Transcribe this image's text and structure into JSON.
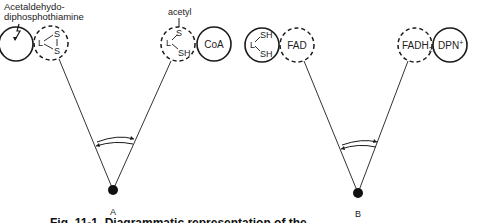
{
  "panels": {
    "A": {
      "label": "A",
      "carrier_label_line1": "Acetaldehydo-",
      "carrier_label_line2": "diphosphothiamine",
      "left_dashed_circle": {
        "L": "L",
        "S_top": "S",
        "S_bottom": "S"
      },
      "right_dashed_circle": {
        "substituent": "acetyl",
        "L": "L",
        "S_top": "S",
        "SH_bottom": "SH"
      },
      "partner_circle": "CoA"
    },
    "B": {
      "label": "B",
      "left_solid_circle": {
        "L": "L",
        "SH_top": "SH",
        "SH_bottom": "SH"
      },
      "left_dashed_circle": "FAD",
      "right_dashed_circle_base": "FADH",
      "right_dashed_circle_sub": "2",
      "partner_circle_base": "DPN",
      "partner_circle_sup": "+"
    }
  },
  "caption": {
    "text": "Fig. 11-1. Diagrammatic representation of the ...",
    "visibility": "partially cut off at bottom edge"
  },
  "colors": {
    "stroke": "#1a1a1a",
    "background": "#ffffff"
  }
}
